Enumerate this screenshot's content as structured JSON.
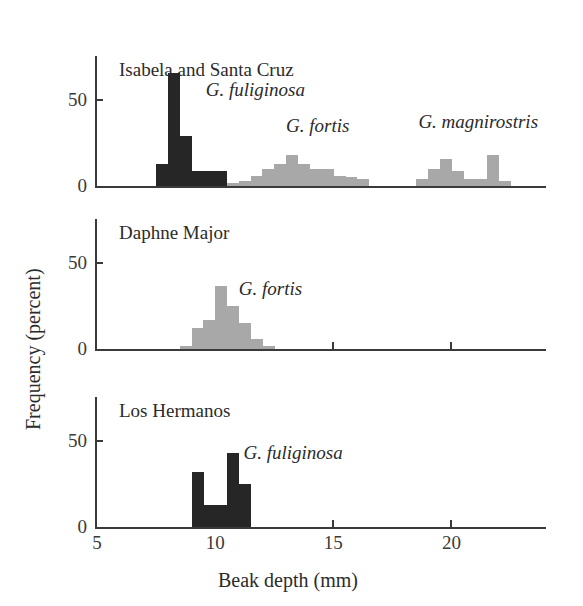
{
  "figure": {
    "xlabel": "Beak depth (mm)",
    "ylabel": "Frequency (percent)"
  },
  "axis": {
    "x_ticks": [
      {
        "value": 5,
        "label": "5"
      },
      {
        "value": 10,
        "label": "10"
      },
      {
        "value": 15,
        "label": "15"
      },
      {
        "value": 20,
        "label": "20"
      }
    ],
    "y_ticks": [
      {
        "value": 0,
        "label": "0"
      },
      {
        "value": 50,
        "label": "50"
      }
    ]
  },
  "chart_data": {
    "type": "bar",
    "title": "",
    "xlabel": "Beak depth (mm)",
    "ylabel": "Frequency (percent)",
    "xlim": [
      5,
      24
    ],
    "ylim": [
      0,
      70
    ],
    "grid": false,
    "legend": "none",
    "bin_width": 0.5,
    "colors": {
      "dark": "#262626",
      "light": "#a8a8a8"
    },
    "panels": [
      {
        "title": "Isabela and Santa Cruz",
        "series": [
          {
            "name": "G. fuliginosa",
            "color": "#262626",
            "label_x": 9.6,
            "label_y": 55,
            "bins": [
              {
                "x": 7.5,
                "value": 13
              },
              {
                "x": 8.0,
                "value": 66
              },
              {
                "x": 8.5,
                "value": 29
              },
              {
                "x": 9.0,
                "value": 9
              },
              {
                "x": 9.5,
                "value": 9
              },
              {
                "x": 10.0,
                "value": 9
              }
            ]
          },
          {
            "name": "G. fortis",
            "color": "#a8a8a8",
            "label_x": 13.0,
            "label_y": 34,
            "bins": [
              {
                "x": 10.5,
                "value": 2
              },
              {
                "x": 11.0,
                "value": 3
              },
              {
                "x": 11.5,
                "value": 6
              },
              {
                "x": 12.0,
                "value": 10
              },
              {
                "x": 12.5,
                "value": 13
              },
              {
                "x": 13.0,
                "value": 18
              },
              {
                "x": 13.5,
                "value": 13
              },
              {
                "x": 14.0,
                "value": 10
              },
              {
                "x": 14.5,
                "value": 10
              },
              {
                "x": 15.0,
                "value": 6
              },
              {
                "x": 15.5,
                "value": 5
              },
              {
                "x": 16.0,
                "value": 4
              }
            ]
          },
          {
            "name": "G. magnirostris",
            "color": "#a8a8a8",
            "label_x": 18.6,
            "label_y": 36,
            "bins": [
              {
                "x": 18.5,
                "value": 4
              },
              {
                "x": 19.0,
                "value": 10
              },
              {
                "x": 19.5,
                "value": 16
              },
              {
                "x": 20.0,
                "value": 9
              },
              {
                "x": 20.5,
                "value": 4
              },
              {
                "x": 21.0,
                "value": 4
              },
              {
                "x": 21.5,
                "value": 18
              },
              {
                "x": 22.0,
                "value": 3
              }
            ]
          }
        ]
      },
      {
        "title": "Daphne Major",
        "series": [
          {
            "name": "G. fortis",
            "color": "#a8a8a8",
            "label_x": 11.0,
            "label_y": 34,
            "bins": [
              {
                "x": 8.5,
                "value": 2
              },
              {
                "x": 9.0,
                "value": 12
              },
              {
                "x": 9.5,
                "value": 17
              },
              {
                "x": 10.0,
                "value": 37
              },
              {
                "x": 10.5,
                "value": 25
              },
              {
                "x": 11.0,
                "value": 15
              },
              {
                "x": 11.5,
                "value": 6
              },
              {
                "x": 12.0,
                "value": 2
              }
            ]
          }
        ]
      },
      {
        "title": "Los Hermanos",
        "series": [
          {
            "name": "G. fuliginosa",
            "color": "#262626",
            "label_x": 11.2,
            "label_y": 42,
            "bins": [
              {
                "x": 9.0,
                "value": 32
              },
              {
                "x": 9.5,
                "value": 13
              },
              {
                "x": 10.0,
                "value": 13
              },
              {
                "x": 10.5,
                "value": 43
              },
              {
                "x": 11.0,
                "value": 25
              }
            ]
          }
        ]
      }
    ]
  }
}
